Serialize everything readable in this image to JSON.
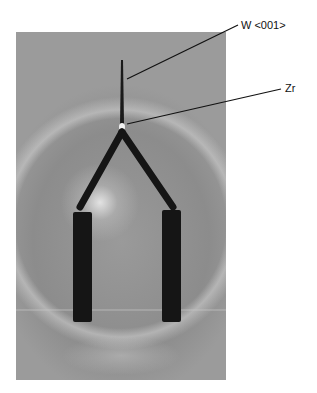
{
  "figure": {
    "labels": [
      {
        "id": "tip",
        "text": "W <001>"
      },
      {
        "id": "coating",
        "text": "Zr"
      }
    ],
    "colors": {
      "background": "#ffffff",
      "photo_gray": "#9a9a9a",
      "filament": "#151515",
      "leader_line": "#111111"
    }
  }
}
